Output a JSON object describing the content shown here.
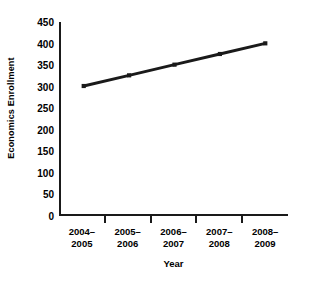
{
  "chart_data": {
    "type": "line",
    "title": "",
    "subtitle": "",
    "xlabel": "Year",
    "ylabel": "Economics Enrollment",
    "categories": [
      "2004–\n2005",
      "2005–\n2006",
      "2006–\n2007",
      "2007–\n2008",
      "2008–\n2009"
    ],
    "category_lines": [
      [
        "2004–",
        "2005"
      ],
      [
        "2005–",
        "2006"
      ],
      [
        "2006–",
        "2007"
      ],
      [
        "2007–",
        "2008"
      ],
      [
        "2008–",
        "2009"
      ]
    ],
    "values": [
      300,
      325,
      350,
      375,
      400
    ],
    "series": [
      {
        "name": "Economics Enrollment",
        "values": [
          300,
          325,
          350,
          375,
          400
        ],
        "color": "#1a1a1a",
        "marker": "square",
        "line_width": 3
      }
    ],
    "ylim": [
      0,
      450
    ],
    "ytick_values": [
      0,
      50,
      100,
      150,
      200,
      250,
      300,
      350,
      400,
      450
    ],
    "ytick_labels": [
      "0",
      "50",
      "100",
      "150",
      "200",
      "250",
      "300",
      "350",
      "400",
      "450"
    ],
    "grid": false,
    "legend": false,
    "legend_position": "none",
    "annotations": [],
    "axis_color": "#1a1a1a",
    "background_color": "#ffffff"
  }
}
